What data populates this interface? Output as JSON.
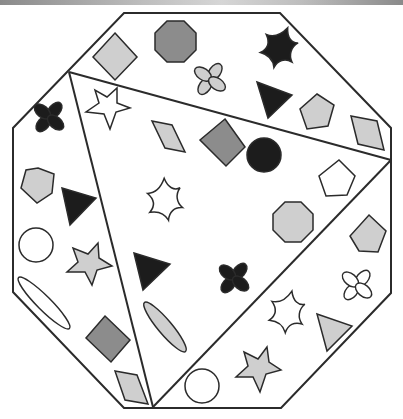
{
  "colors": {
    "stroke": "#2b2b2b",
    "black": "#1c1c1c",
    "dark_gray": "#8c8c8c",
    "light_gray": "#cfcfcf",
    "white": "#ffffff"
  },
  "octagon": {
    "points": "124,13 280,13 391,128 391,293 281,408 124,408 13,292 13,128"
  },
  "dividers": [
    {
      "name": "divider-top",
      "x1": 69,
      "y1": 72,
      "x2": 391,
      "y2": 160
    },
    {
      "name": "divider-left",
      "x1": 69,
      "y1": 72,
      "x2": 153,
      "y2": 407
    },
    {
      "name": "divider-right",
      "x1": 391,
      "y1": 160,
      "x2": 153,
      "y2": 407
    }
  ],
  "regions": [
    {
      "name": "top-region",
      "shapes": [
        {
          "type": "diamond",
          "fill": "light_gray",
          "cx": 115,
          "cy": 56
        },
        {
          "type": "octagon",
          "fill": "dark_gray",
          "cx": 175,
          "cy": 41
        },
        {
          "type": "pinwheel",
          "fill": "black",
          "cx": 282,
          "cy": 49
        },
        {
          "type": "flower",
          "fill": "light_gray",
          "cx": 210,
          "cy": 79
        },
        {
          "type": "triangle",
          "fill": "black",
          "cx": 273,
          "cy": 98
        },
        {
          "type": "pentagon",
          "fill": "light_gray",
          "cx": 316,
          "cy": 113
        },
        {
          "type": "rhombus",
          "fill": "light_gray",
          "cx": 368,
          "cy": 130
        }
      ]
    },
    {
      "name": "left-region",
      "shapes": [
        {
          "type": "flower",
          "fill": "black",
          "cx": 49,
          "cy": 117
        },
        {
          "type": "pentagon",
          "fill": "light_gray",
          "cx": 36,
          "cy": 185
        },
        {
          "type": "triangle",
          "fill": "black",
          "cx": 75,
          "cy": 205
        },
        {
          "type": "circle",
          "fill": "white",
          "cx": 36,
          "cy": 245
        },
        {
          "type": "star",
          "fill": "light_gray",
          "cx": 88,
          "cy": 265
        },
        {
          "type": "ellipse",
          "fill": "white",
          "cx": 44,
          "cy": 303
        },
        {
          "type": "diamond",
          "fill": "dark_gray",
          "cx": 108,
          "cy": 339
        },
        {
          "type": "rhombus",
          "fill": "light_gray",
          "cx": 131,
          "cy": 385
        }
      ]
    },
    {
      "name": "center-region",
      "shapes": [
        {
          "type": "star",
          "fill": "white",
          "cx": 108,
          "cy": 109
        },
        {
          "type": "rhombus",
          "fill": "light_gray",
          "cx": 168,
          "cy": 137
        },
        {
          "type": "diamond",
          "fill": "dark_gray",
          "cx": 222,
          "cy": 142
        },
        {
          "type": "circle",
          "fill": "black",
          "cx": 264,
          "cy": 155
        },
        {
          "type": "pentagon",
          "fill": "white",
          "cx": 337,
          "cy": 178
        },
        {
          "type": "pinwheel",
          "fill": "white",
          "cx": 168,
          "cy": 200
        },
        {
          "type": "octagon",
          "fill": "light_gray",
          "cx": 293,
          "cy": 222
        },
        {
          "type": "triangle",
          "fill": "black",
          "cx": 150,
          "cy": 266
        },
        {
          "type": "flower",
          "fill": "black",
          "cx": 234,
          "cy": 278
        },
        {
          "type": "ellipse",
          "fill": "light_gray",
          "cx": 165,
          "cy": 327
        }
      ]
    },
    {
      "name": "right-region",
      "shapes": [
        {
          "type": "pentagon",
          "fill": "light_gray",
          "cx": 368,
          "cy": 233
        },
        {
          "type": "flower",
          "fill": "white",
          "cx": 357,
          "cy": 285
        },
        {
          "type": "pinwheel",
          "fill": "white",
          "cx": 290,
          "cy": 313
        },
        {
          "type": "triangle",
          "fill": "light_gray",
          "cx": 332,
          "cy": 330
        },
        {
          "type": "star",
          "fill": "light_gray",
          "cx": 258,
          "cy": 370
        },
        {
          "type": "circle",
          "fill": "white",
          "cx": 202,
          "cy": 386
        }
      ]
    }
  ]
}
